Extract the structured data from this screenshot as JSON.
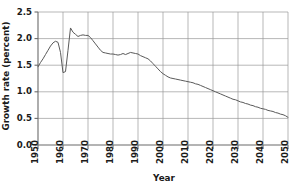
{
  "chart_data": {
    "type": "line",
    "title": "",
    "xlabel": "Year",
    "ylabel": "Growth rate (percent)",
    "xlim": [
      1950,
      2050
    ],
    "ylim": [
      0.0,
      2.5
    ],
    "grid": true,
    "legend": false,
    "xticks": [
      1950,
      1960,
      1970,
      1980,
      1990,
      2000,
      2010,
      2020,
      2030,
      2040,
      2050
    ],
    "xtick_labels": [
      "1950",
      "1960",
      "1970",
      "1980",
      "1990",
      "2000",
      "2010",
      "2020",
      "2030",
      "2040",
      "2050"
    ],
    "yticks": [
      0.0,
      0.5,
      1.0,
      1.5,
      2.0,
      2.5
    ],
    "ytick_labels": [
      "0.0",
      "0.5",
      "1.0",
      "1.5",
      "2.0",
      "2.5"
    ],
    "line_color": "#5a5a5a",
    "grid_color": "#9a9a9a",
    "axis_color": "#6b6b6b",
    "series": [
      {
        "name": "World population growth rate",
        "x": [
          1950,
          1951,
          1952,
          1953,
          1954,
          1955,
          1956,
          1957,
          1958,
          1959,
          1960,
          1961,
          1962,
          1963,
          1964,
          1965,
          1966,
          1967,
          1968,
          1969,
          1970,
          1971,
          1972,
          1973,
          1974,
          1975,
          1976,
          1977,
          1978,
          1979,
          1980,
          1981,
          1982,
          1983,
          1984,
          1985,
          1986,
          1987,
          1988,
          1989,
          1990,
          1991,
          1992,
          1993,
          1994,
          1995,
          1996,
          1997,
          1998,
          1999,
          2000,
          2001,
          2002,
          2003,
          2004,
          2005,
          2006,
          2007,
          2008,
          2009,
          2010,
          2011,
          2012,
          2013,
          2014,
          2015,
          2016,
          2017,
          2018,
          2019,
          2020,
          2021,
          2022,
          2023,
          2024,
          2025,
          2026,
          2027,
          2028,
          2029,
          2030,
          2031,
          2032,
          2033,
          2034,
          2035,
          2036,
          2037,
          2038,
          2039,
          2040,
          2041,
          2042,
          2043,
          2044,
          2045,
          2046,
          2047,
          2048,
          2049,
          2050
        ],
        "y": [
          1.47,
          1.55,
          1.62,
          1.7,
          1.78,
          1.86,
          1.92,
          1.95,
          1.93,
          1.74,
          1.36,
          1.38,
          1.78,
          2.2,
          2.12,
          2.08,
          2.04,
          2.06,
          2.07,
          2.06,
          2.06,
          2.02,
          1.96,
          1.9,
          1.84,
          1.78,
          1.74,
          1.73,
          1.72,
          1.71,
          1.71,
          1.7,
          1.69,
          1.7,
          1.72,
          1.7,
          1.72,
          1.74,
          1.73,
          1.72,
          1.71,
          1.68,
          1.66,
          1.64,
          1.62,
          1.58,
          1.53,
          1.48,
          1.43,
          1.38,
          1.34,
          1.31,
          1.28,
          1.26,
          1.25,
          1.24,
          1.23,
          1.22,
          1.21,
          1.2,
          1.19,
          1.18,
          1.17,
          1.15,
          1.14,
          1.12,
          1.1,
          1.08,
          1.06,
          1.04,
          1.02,
          1.0,
          0.98,
          0.96,
          0.94,
          0.92,
          0.9,
          0.88,
          0.86,
          0.85,
          0.83,
          0.81,
          0.8,
          0.78,
          0.77,
          0.75,
          0.74,
          0.72,
          0.71,
          0.69,
          0.68,
          0.67,
          0.65,
          0.64,
          0.63,
          0.61,
          0.6,
          0.58,
          0.57,
          0.55,
          0.52
        ]
      }
    ]
  }
}
